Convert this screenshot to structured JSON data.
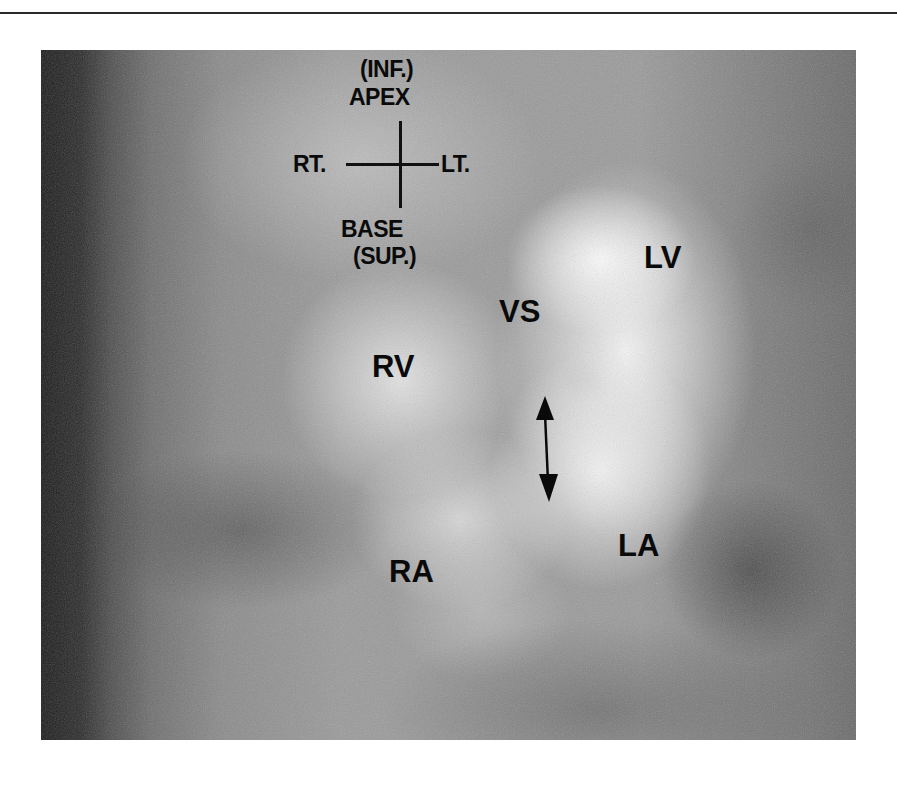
{
  "figure": {
    "orientation_key": {
      "top_line1": "(INF.)",
      "top_line2": "APEX",
      "left": "RT.",
      "right": "LT.",
      "bottom_line1": "BASE",
      "bottom_line2": "(SUP.)"
    },
    "labels": {
      "lv": "LV",
      "vs": "VS",
      "rv": "RV",
      "ra": "RA",
      "la": "LA"
    },
    "arrow": "double-headed-vertical-arrow"
  }
}
